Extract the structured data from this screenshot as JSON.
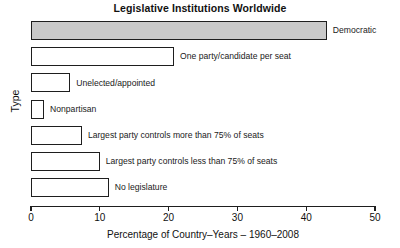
{
  "chart_data": {
    "type": "bar",
    "orientation": "horizontal",
    "title": "Legislative Institutions Worldwide",
    "xlabel": "Percentage of Country–Years – 1960–2008",
    "ylabel": "Type",
    "xlim": [
      0,
      50
    ],
    "xticks": [
      0,
      10,
      20,
      30,
      40,
      50
    ],
    "xtick_labels": [
      "0",
      "10",
      "20",
      "30",
      "40",
      "50"
    ],
    "grid": false,
    "legend": "none",
    "categories": [
      "Democratic",
      "One party/candidate per seat",
      "Unelected/appointed",
      "Nonpartisan",
      "Largest party controls more than 75% of seats",
      "Largest party controls less than 75% of seats",
      "No legislature"
    ],
    "values": [
      43.0,
      20.8,
      5.7,
      1.9,
      7.4,
      10.0,
      11.3
    ],
    "bars": [
      {
        "label": "Democratic",
        "value": 43.0,
        "fill": "#c9c9c9"
      },
      {
        "label": "One party/candidate per seat",
        "value": 20.8,
        "fill": "#ffffff"
      },
      {
        "label": "Unelected/appointed",
        "value": 5.7,
        "fill": "#ffffff"
      },
      {
        "label": "Nonpartisan",
        "value": 1.9,
        "fill": "#ffffff"
      },
      {
        "label": "Largest party controls more than 75% of seats",
        "value": 7.4,
        "fill": "#ffffff"
      },
      {
        "label": "Largest party controls less than 75% of seats",
        "value": 10.0,
        "fill": "#ffffff"
      },
      {
        "label": "No legislature",
        "value": 11.3,
        "fill": "#ffffff"
      }
    ],
    "colors": {
      "axis": "#1e1e1e",
      "bar_edge": "#1e1e1e",
      "bar_fill_default": "#ffffff",
      "bar_fill_highlight": "#c9c9c9",
      "background": "#ffffff",
      "text": "#111111"
    }
  }
}
